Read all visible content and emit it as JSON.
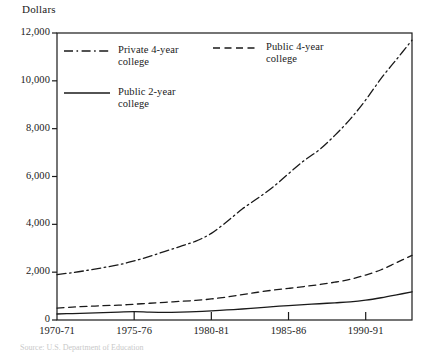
{
  "chart_data": {
    "type": "line",
    "title": "",
    "ylabel": "Dollars",
    "xlabel": "",
    "ylim": [
      0,
      12000
    ],
    "grid": false,
    "legend_position": "inside-top",
    "y_ticks": [
      "0",
      "2,000",
      "4,000",
      "6,000",
      "8,000",
      "10,000",
      "12,000"
    ],
    "y_tick_values": [
      0,
      2000,
      4000,
      6000,
      8000,
      10000,
      12000
    ],
    "x_ticks": [
      "1970-71",
      "1975-76",
      "1980-81",
      "1985-86",
      "1990-91"
    ],
    "x_tick_values": [
      1970,
      1975,
      1980,
      1985,
      1990
    ],
    "x_range": [
      1970,
      1993
    ],
    "categories": [
      1970,
      1971,
      1972,
      1973,
      1974,
      1975,
      1976,
      1977,
      1978,
      1979,
      1980,
      1981,
      1982,
      1983,
      1984,
      1985,
      1986,
      1987,
      1988,
      1989,
      1990,
      1991,
      1992,
      1993
    ],
    "series": [
      {
        "name": "Private 4-year college",
        "style": "dash-dot",
        "color": "#1a1a1a",
        "values": [
          1900,
          1980,
          2080,
          2190,
          2310,
          2470,
          2660,
          2870,
          3080,
          3300,
          3620,
          4110,
          4640,
          5090,
          5560,
          6120,
          6660,
          7120,
          7720,
          8400,
          9200,
          10100,
          10900,
          11700
        ]
      },
      {
        "name": "Public 4-year college",
        "style": "dashed",
        "color": "#1a1a1a",
        "values": [
          500,
          540,
          570,
          600,
          620,
          660,
          700,
          740,
          780,
          820,
          880,
          960,
          1060,
          1160,
          1250,
          1320,
          1400,
          1480,
          1580,
          1700,
          1880,
          2100,
          2400,
          2700
        ]
      },
      {
        "name": "Public 2-year college",
        "style": "solid",
        "color": "#1a1a1a",
        "values": [
          250,
          270,
          290,
          310,
          330,
          350,
          330,
          320,
          330,
          350,
          380,
          420,
          460,
          510,
          560,
          600,
          640,
          680,
          720,
          760,
          830,
          930,
          1050,
          1180
        ]
      }
    ]
  },
  "legend": [
    {
      "label_line1": "Private 4-year",
      "label_line2": "college",
      "style": "dash-dot"
    },
    {
      "label_line1": "Public 4-year",
      "label_line2": "college",
      "style": "dashed"
    },
    {
      "label_line1": "Public 2-year",
      "label_line2": "college",
      "style": "solid"
    }
  ],
  "source_note": "Source: U.S. Department of Education"
}
